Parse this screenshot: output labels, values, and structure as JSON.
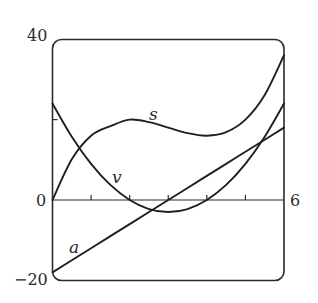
{
  "chart_data": {
    "type": "line",
    "title": "",
    "xlabel": "",
    "ylabel": "",
    "xlim": [
      0,
      6
    ],
    "ylim": [
      -20,
      40
    ],
    "grid": false,
    "legend": "inline labels",
    "x_tick_labels": [
      {
        "value": 0,
        "label": "0"
      },
      {
        "value": 6,
        "label": "6"
      }
    ],
    "x_minor_ticks": [
      1,
      2,
      3,
      4,
      5
    ],
    "y_tick_labels": [
      {
        "value": 40,
        "label": "40"
      },
      {
        "value": 0,
        "label": "0"
      },
      {
        "value": -20,
        "label": "−20"
      }
    ],
    "y_minor_ticks": [
      20
    ],
    "x": [
      0,
      0.5,
      1,
      1.5,
      2,
      2.5,
      3,
      3.5,
      4,
      4.5,
      5,
      5.5,
      6
    ],
    "series": [
      {
        "name": "s",
        "formula": "t^3 - 9t^2 + 24t",
        "values": [
          0,
          10.125,
          16,
          18.375,
          20,
          19.375,
          18,
          16.625,
          16,
          16.875,
          20,
          26.125,
          36
        ]
      },
      {
        "name": "v",
        "formula": "3t^2 - 18t + 24",
        "values": [
          24,
          15.75,
          9,
          3.75,
          0,
          -2.25,
          -3,
          -2.25,
          0,
          3.75,
          9,
          15.75,
          24
        ]
      },
      {
        "name": "a",
        "formula": "6t - 18",
        "values": [
          -18,
          -15,
          -12,
          -9,
          -6,
          -3,
          0,
          3,
          6,
          9,
          12,
          15,
          18
        ]
      }
    ],
    "annotations": [
      {
        "text": "s",
        "x": 2.6,
        "y": 21.5
      },
      {
        "text": "v",
        "x": 1.7,
        "y": 4.5
      },
      {
        "text": "a",
        "x": 0.6,
        "y": -11.5
      }
    ]
  },
  "labels": {
    "y_top": "40",
    "y_zero": "0",
    "y_bottom": "−20",
    "x_right": "6",
    "series_s": "s",
    "series_v": "v",
    "series_a": "a"
  }
}
